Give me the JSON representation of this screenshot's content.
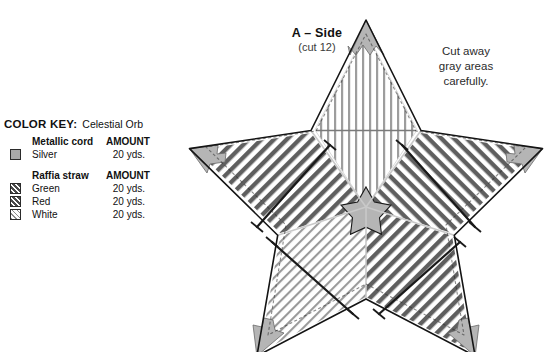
{
  "color_key": {
    "title": "COLOR KEY:",
    "product": "Celestial Orb",
    "groups": [
      {
        "name": "Metallic cord",
        "amount_header": "AMOUNT",
        "rows": [
          {
            "color": "Silver",
            "amount": "20 yds.",
            "swatch": "solid-gray"
          }
        ]
      },
      {
        "name": "Raffia straw",
        "amount_header": "AMOUNT",
        "rows": [
          {
            "color": "Green",
            "amount": "20 yds.",
            "swatch": "dark-hatch"
          },
          {
            "color": "Red",
            "amount": "20 yds.",
            "swatch": "dark-hatch"
          },
          {
            "color": "White",
            "amount": "20 yds.",
            "swatch": "light-hatch"
          }
        ]
      }
    ]
  },
  "diagram": {
    "title": "A – Side",
    "subtitle": "(cut 12)",
    "cut_note": "Cut away\ngray areas\ncarefully.",
    "cut_note_lines": [
      "Cut away",
      "gray areas",
      "carefully."
    ],
    "shape": "five-pointed-star",
    "segments": [
      {
        "id": "top",
        "stitch": "vertical",
        "color": "White"
      },
      {
        "id": "upper-left",
        "stitch": "diagonal",
        "color": "Green"
      },
      {
        "id": "upper-right",
        "stitch": "diagonal",
        "color": "Red"
      },
      {
        "id": "lower-left",
        "stitch": "diagonal-light",
        "color": "White"
      },
      {
        "id": "lower-right",
        "stitch": "diagonal",
        "color": "Red"
      }
    ],
    "gray_areas": [
      "point-tips",
      "center-star"
    ],
    "colors": {
      "gray_fill": "#b3b3b3",
      "dark_stitch": "#5a5a5a",
      "light_stitch": "#8f8f8f",
      "outline": "#1a1a1a",
      "guide_line": "#1a1a1a",
      "seam_line": "#c8c8c8"
    }
  }
}
